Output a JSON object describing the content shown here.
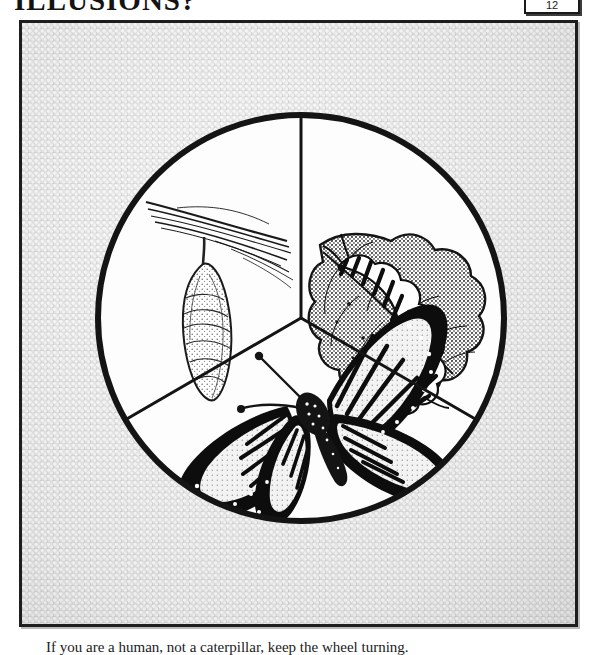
{
  "page": {
    "heading": "ILLUSIONS?",
    "badge_label": "12",
    "caption": "If you are a human, not a caterpillar, keep the wheel turning."
  },
  "plate": {
    "title": "Butterfly Life Cycle Wheel",
    "background_style": "stippled-halftone",
    "frame_color": "#1d1d1d",
    "paper_color": "#e6e6e6",
    "ink_color": "#111111"
  },
  "wheel": {
    "shape": "circle-divided-in-three-sectors",
    "divider_count": 3,
    "sectors": [
      {
        "id": "sector-chrysalis",
        "position": "upper-left",
        "stage_name": "Chrysalis",
        "subject": "pupa hanging from a twig",
        "elements": [
          "twig",
          "silk-attachment",
          "chrysalis"
        ]
      },
      {
        "id": "sector-caterpillar",
        "position": "upper-right",
        "stage_name": "Caterpillar",
        "subject": "striped larva feeding on a leaf",
        "elements": [
          "leaf",
          "leaf-veins",
          "striped-caterpillar"
        ]
      },
      {
        "id": "sector-butterfly",
        "position": "bottom",
        "stage_name": "Butterfly",
        "subject": "adult monarch butterfly",
        "elements": [
          "wings",
          "antennae",
          "body-spots"
        ]
      }
    ]
  }
}
